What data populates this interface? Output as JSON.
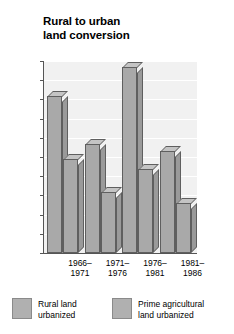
{
  "chart_data": {
    "type": "bar",
    "title": "Rural to urban land conversion",
    "title_lines": [
      "Rural to urban",
      "land conversion"
    ],
    "xlabel": "",
    "ylabel": "Thousands of hectares",
    "ylim": [
      0,
      100
    ],
    "ytick_values": [
      0,
      10,
      20,
      30,
      40,
      50,
      60,
      70,
      80,
      90,
      100
    ],
    "ytick_labels": [
      "0",
      "10",
      "20",
      "30",
      "40",
      "50",
      "60",
      "70",
      "80",
      "90",
      "100"
    ],
    "grid": true,
    "grid_color": "#ffffff",
    "plot_background": "#f1f1f1",
    "bar_color": "#a9a9a9",
    "bar_outline": "#5f5f5f",
    "legend_position": "bottom",
    "categories": [
      "1966–1971",
      "1971–1976",
      "1976–1981",
      "1981–1986"
    ],
    "category_lines": [
      [
        "1966–",
        "1971"
      ],
      [
        "1971–",
        "1976"
      ],
      [
        "1976–",
        "1981"
      ],
      [
        "1981–",
        "1986"
      ]
    ],
    "series": [
      {
        "name": "Rural land urbanized",
        "legend_lines": [
          "Rural land",
          "urbanized"
        ],
        "values": [
          82,
          57,
          97,
          53
        ]
      },
      {
        "name": "Prime agricultural land urbanized",
        "legend_lines": [
          "Prime agricultural",
          "land urbanized"
        ],
        "values": [
          49,
          32,
          44,
          26
        ]
      }
    ]
  }
}
